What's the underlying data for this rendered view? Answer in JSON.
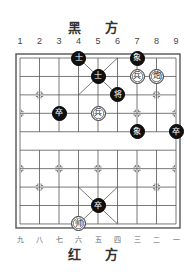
{
  "header": {
    "title": "黑 方"
  },
  "footer": {
    "title": "红 方"
  },
  "top_column_labels": [
    "1",
    "2",
    "3",
    "4",
    "5",
    "6",
    "7",
    "8",
    "9"
  ],
  "bottom_column_labels": [
    "九",
    "八",
    "七",
    "六",
    "五",
    "四",
    "三",
    "二",
    "一"
  ],
  "board": {
    "columns": 9,
    "rows": 10,
    "line_color": "#555555",
    "background": "#ffffff"
  },
  "pieces": [
    {
      "side": "black",
      "char": "士",
      "col": 4,
      "row": 0
    },
    {
      "side": "black",
      "char": "象",
      "col": 7,
      "row": 0
    },
    {
      "side": "black",
      "char": "士",
      "col": 5,
      "row": 1
    },
    {
      "side": "red",
      "char": "兵",
      "col": 7,
      "row": 1
    },
    {
      "side": "red",
      "char": "炮",
      "col": 8,
      "row": 1
    },
    {
      "side": "black",
      "char": "将",
      "col": 6,
      "row": 2
    },
    {
      "side": "black",
      "char": "卒",
      "col": 3,
      "row": 3
    },
    {
      "side": "red",
      "char": "兵",
      "col": 5,
      "row": 3
    },
    {
      "side": "black",
      "char": "象",
      "col": 7,
      "row": 4
    },
    {
      "side": "black",
      "char": "卒",
      "col": 9,
      "row": 4
    },
    {
      "side": "black",
      "char": "卒",
      "col": 5,
      "row": 8
    },
    {
      "side": "red",
      "char": "帅",
      "col": 4,
      "row": 9
    }
  ]
}
